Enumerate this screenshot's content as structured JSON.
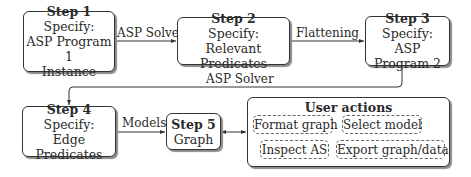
{
  "steps": [
    {
      "title": "Step 1",
      "lines": [
        "Specify:",
        "ASP Program 1",
        "Instance"
      ]
    },
    {
      "title": "Step 2",
      "lines": [
        "Specify:",
        "Relevant Predicates"
      ]
    },
    {
      "title": "Step 3",
      "lines": [
        "Specify:",
        "ASP Program 2"
      ]
    },
    {
      "title": "Step 4",
      "lines": [
        "Specify:",
        "Edge Predicates"
      ]
    },
    {
      "title": "Step 5",
      "lines": [
        "Graph"
      ]
    }
  ],
  "edges": {
    "step1_to_step2": "ASP Solver",
    "step2_to_step3": "Flattening",
    "step3_to_step4": "ASP Solver",
    "step4_to_step5": "Models"
  },
  "user_actions": {
    "title": "User actions",
    "items": [
      "Format graph",
      "Select model",
      "Inspect AS",
      "Export graph/data"
    ]
  }
}
